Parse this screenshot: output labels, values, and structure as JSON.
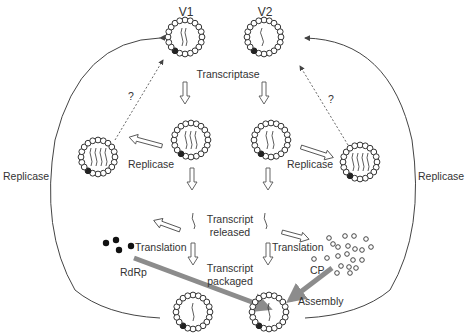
{
  "diagram": {
    "type": "virus replication cycle schematic",
    "virions": {
      "v1_label": "V1",
      "v2_label": "V2"
    },
    "labels": {
      "transcriptase": "Transcriptase",
      "replicase_left_inner": "Replicase",
      "replicase_right_inner": "Replicase",
      "replicase_left_outer": "Replicase",
      "replicase_right_outer": "Replicase",
      "question_left": "?",
      "question_right": "?",
      "transcript_released_1": "Transcript",
      "transcript_released_2": "released",
      "translation_left": "Translation",
      "translation_right": "Translation",
      "transcript_packaged_1": "Transcript",
      "transcript_packaged_2": "packaged",
      "rdrp": "RdRp",
      "cp": "CP",
      "assembly": "Assembly"
    },
    "colors": {
      "line": "#444444",
      "thick_arrow": "#8c8c8c",
      "text": "#333333"
    }
  }
}
